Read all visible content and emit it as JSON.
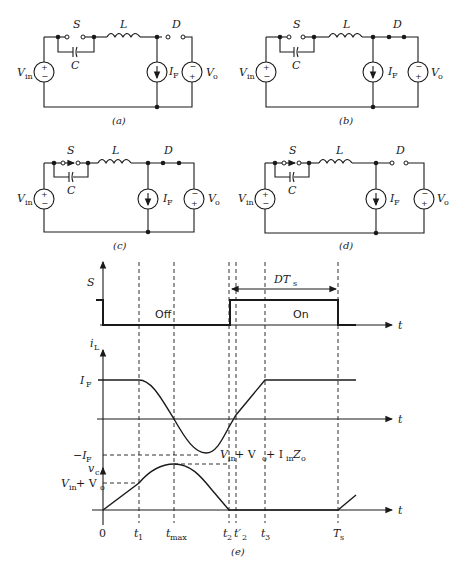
{
  "circuits": [
    {
      "caption": "(a)",
      "switch": "open",
      "diode": "open"
    },
    {
      "caption": "(b)",
      "switch": "open",
      "diode": "closed"
    },
    {
      "caption": "(c)",
      "switch": "closing",
      "diode": "closed"
    },
    {
      "caption": "(d)",
      "switch": "closing",
      "diode": "open"
    }
  ],
  "labels": {
    "S": "S",
    "L": "L",
    "D": "D",
    "C": "C",
    "Vin_main": "V",
    "Vin_sub": "in",
    "IF_main": "I",
    "IF_sub": "F",
    "Vo_main": "V",
    "Vo_sub": "o",
    "plus": "+",
    "minus": "−"
  },
  "timing": {
    "caption": "(e)",
    "S_label": "S",
    "iL_main": "i",
    "iL_sub": "L",
    "vc_main": "v",
    "vc_sub": "c",
    "t_axis": "t",
    "off_label": "Off",
    "on_label": "On",
    "DTs_main": "DT",
    "DTs_sub": "s",
    "IF_main": "I",
    "IF_sub": "F",
    "negIF_main": "−I",
    "negIF_sub": "F",
    "vinvo_label_a": "V",
    "vinvo_label_b": "in",
    "vinvo_label_c": " + V",
    "vinvo_label_d": "o",
    "peak_label_1": "V",
    "peak_label_2": "in",
    "peak_label_3": " + V",
    "peak_label_4": "o",
    "peak_label_5": " + I",
    "peak_label_6": "in",
    "peak_label_7": "Z",
    "peak_label_8": "o",
    "ticks": {
      "zero": "0",
      "t1_main": "t",
      "t1_sub": "1",
      "tmax_main": "t",
      "tmax_sub": "max",
      "t2_main": "t",
      "t2_sub": "2",
      "t2p_main": "t′",
      "t2p_sub": "2",
      "t3_main": "t",
      "t3_sub": "3",
      "Ts_main": "T",
      "Ts_sub": "s"
    }
  }
}
